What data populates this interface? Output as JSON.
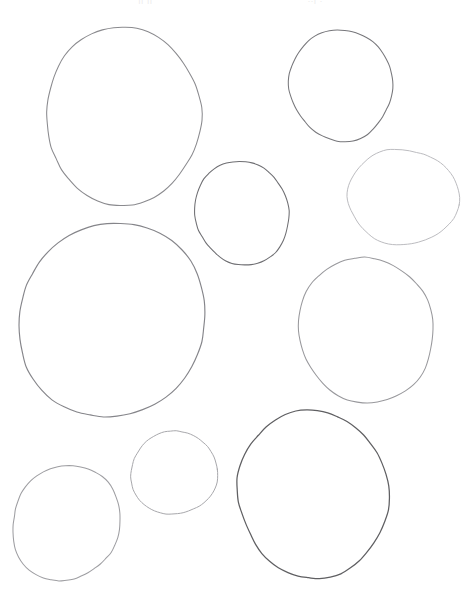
{
  "page": {
    "width": 461,
    "height": 593,
    "background_color": "#ffffff"
  },
  "header": {
    "fragment_left": "|| ||   '",
    "fragment_right": "..| .",
    "color": "#dcdcdc",
    "note": "cropped text fragments at top edge, illegible"
  },
  "shapes": {
    "count": 9,
    "stroke_colors": {
      "darkest": "#5f5f62",
      "dark": "#6e6e72",
      "medium": "#8a8a8e",
      "light": "#a8a8ac",
      "lightest": "#bcbcc0"
    },
    "items": [
      {
        "name": "circle-top-left-large",
        "label": "Circle 1",
        "cx": 123,
        "cy": 116,
        "rx": 79,
        "ry": 87,
        "stroke": "#8a8a8e",
        "stroke_width": 1.05,
        "rotation": -6,
        "wobble": 3.0,
        "seed": 11
      },
      {
        "name": "circle-top-right-medium",
        "label": "Circle 2",
        "cx": 341,
        "cy": 85,
        "rx": 53,
        "ry": 54,
        "stroke": "#77777b",
        "stroke_width": 1.05,
        "rotation": 4,
        "wobble": 2.4,
        "seed": 23
      },
      {
        "name": "circle-center-small",
        "label": "Circle 3",
        "cx": 242,
        "cy": 213,
        "rx": 46,
        "ry": 53,
        "stroke": "#6e6e72",
        "stroke_width": 1.05,
        "rotation": -3,
        "wobble": 2.2,
        "seed": 37
      },
      {
        "name": "circle-right-upper-small",
        "label": "Circle 4",
        "cx": 403,
        "cy": 197,
        "rx": 54,
        "ry": 49,
        "stroke": "#bcbcc0",
        "stroke_width": 1.0,
        "rotation": 8,
        "wobble": 2.1,
        "seed": 51
      },
      {
        "name": "circle-left-largest",
        "label": "Circle 5",
        "cx": 112,
        "cy": 320,
        "rx": 94,
        "ry": 97,
        "stroke": "#85858a",
        "stroke_width": 1.15,
        "rotation": 5,
        "wobble": 3.4,
        "seed": 67
      },
      {
        "name": "circle-right-middle",
        "label": "Circle 6",
        "cx": 366,
        "cy": 330,
        "rx": 69,
        "ry": 71,
        "stroke": "#98989c",
        "stroke_width": 1.05,
        "rotation": -9,
        "wobble": 2.6,
        "seed": 83
      },
      {
        "name": "circle-bottom-right-large",
        "label": "Circle 7",
        "cx": 313,
        "cy": 494,
        "rx": 75,
        "ry": 84,
        "stroke": "#5f5f62",
        "stroke_width": 1.25,
        "rotation": 3,
        "wobble": 2.8,
        "seed": 97
      },
      {
        "name": "circle-bottom-center-small",
        "label": "Circle 8",
        "cx": 174,
        "cy": 473,
        "rx": 42,
        "ry": 43,
        "stroke": "#a8a8ac",
        "stroke_width": 1.0,
        "rotation": -5,
        "wobble": 2.0,
        "seed": 113
      },
      {
        "name": "circle-bottom-left-medium",
        "label": "Circle 9",
        "cx": 66,
        "cy": 523,
        "rx": 54,
        "ry": 58,
        "stroke": "#9e9ea2",
        "stroke_width": 1.05,
        "rotation": 7,
        "wobble": 2.5,
        "seed": 131
      }
    ]
  }
}
